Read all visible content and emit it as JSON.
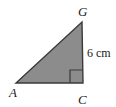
{
  "figure": {
    "name": "right-triangle-AGC",
    "canvas": {
      "width": 116,
      "height": 107
    },
    "background_color": "#ffffff",
    "fill_color": "#8c8c8c",
    "stroke_color": "#3a3a3a",
    "label_color": "#1a1a1a",
    "vertices": {
      "A": {
        "x": 16,
        "y": 83,
        "label": "A"
      },
      "C": {
        "x": 83,
        "y": 83,
        "label": "C"
      },
      "G": {
        "x": 82,
        "y": 22,
        "label": "G"
      }
    },
    "polygon_points": "16,83 83,83 82,22",
    "right_angle": {
      "at": "C",
      "marker_size": 13,
      "marker_points": "70,83 70,70 83,70"
    },
    "labels": {
      "vertex_a": "A",
      "vertex_c": "C",
      "vertex_g": "G",
      "side_gc_measure": "6 cm"
    },
    "label_positions": {
      "vertex_a": {
        "x": 9,
        "y": 96
      },
      "vertex_c": {
        "x": 79,
        "y": 103
      },
      "vertex_g": {
        "x": 79,
        "y": 15
      },
      "side_gc_measure": {
        "x": 87,
        "y": 56
      }
    }
  }
}
